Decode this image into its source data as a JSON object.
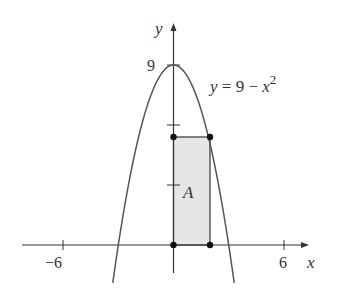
{
  "chart_data": {
    "type": "line",
    "title": "",
    "xlabel": "x",
    "ylabel": "y",
    "xlim": [
      -7.8,
      7.3
    ],
    "ylim": [
      -1.4,
      11.1
    ],
    "grid": false,
    "x_ticks": [
      -6,
      6
    ],
    "x_tick_labels": [
      "−6",
      "6"
    ],
    "y_ticks": [
      3,
      6,
      9
    ],
    "y_tick_labels": [
      "",
      "",
      "9"
    ],
    "series": [
      {
        "name": "y = 9 − x²",
        "function": "9 - x^2",
        "x_range": [
          -3.3,
          3.3
        ]
      }
    ],
    "annotations": [
      {
        "text": "y = 9 − x²",
        "x": 2,
        "y": 8.2
      },
      {
        "text": "A",
        "x": 0.5,
        "y": 2.8,
        "description": "area of shaded rectangle"
      }
    ],
    "rectangle": {
      "x0": 0,
      "y0": 0,
      "x1": 2,
      "y1": 5.4,
      "fill": "#e6e6e6",
      "corner_points": [
        [
          0,
          0
        ],
        [
          2,
          0
        ],
        [
          0,
          5.4
        ],
        [
          2,
          5.4
        ]
      ]
    }
  },
  "labels": {
    "y_axis": "y",
    "x_axis": "x",
    "y_top": "9",
    "x_neg": "−6",
    "x_pos": "6",
    "eq_y": "y",
    "eq_mid": " = 9 − ",
    "eq_x": "x",
    "eq_exp": "2",
    "area": "A"
  },
  "colors": {
    "line": "#333333",
    "fill": "#e6e6e6",
    "background": "#ffffff"
  }
}
